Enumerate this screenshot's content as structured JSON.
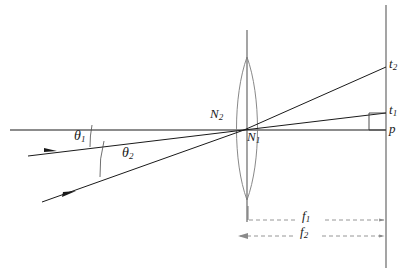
{
  "figure": {
    "kind": "optical-ray-diagram",
    "title": "",
    "background_color": "#ffffff",
    "line_color": "#1a1a1a",
    "dashed_color": "#8a8a8a",
    "thin_color": "#6f6f6f"
  },
  "labels": {
    "theta1": {
      "base": "θ",
      "sub": "1",
      "x": 77,
      "y": 136
    },
    "theta2": {
      "base": "θ",
      "sub": "2",
      "x": 124,
      "y": 152
    },
    "n2": {
      "base": "N",
      "sub": "2",
      "x": 212,
      "y": 113
    },
    "n1": {
      "base": "N",
      "sub": "1",
      "x": 249,
      "y": 134
    },
    "t2": {
      "base": "t",
      "sub": "2",
      "x": 390,
      "y": 62
    },
    "t1": {
      "base": "t",
      "sub": "1",
      "x": 390,
      "y": 108
    },
    "p": {
      "base": "p",
      "sub": "",
      "x": 390,
      "y": 125
    },
    "f1": {
      "base": "f",
      "sub": "1",
      "x": 308,
      "y": 215
    },
    "f2": {
      "base": "f",
      "sub": "2",
      "x": 306,
      "y": 231
    }
  },
  "geometry": {
    "optical_axis": {
      "x1": 10,
      "y1": 130,
      "x2": 386,
      "y2": 130
    },
    "lens_axis": {
      "x1": 247,
      "y1": 30,
      "x2": 247,
      "y2": 222
    },
    "lens_top_vertex": {
      "x": 247,
      "y": 57
    },
    "lens_bottom_vertex": {
      "x": 247,
      "y": 200
    },
    "lens_half_width": 14,
    "screen": {
      "x": 386,
      "y1": 5,
      "y2": 268
    },
    "nodal_point": {
      "x": 244,
      "y": 130
    },
    "ray1_in": {
      "x1": 28,
      "y1": 156,
      "x2": 244,
      "y2": 130
    },
    "ray1_out": {
      "x1": 244,
      "y1": 130,
      "x2": 386,
      "y2": 113
    },
    "ray2_in": {
      "x1": 42,
      "y1": 202,
      "x2": 244,
      "y2": 130
    },
    "ray2_out": {
      "x1": 244,
      "y1": 130,
      "x2": 386,
      "y2": 67
    },
    "right_angle_marker": {
      "x": 369,
      "y": 113,
      "size": 17
    },
    "f1_dim": {
      "x1": 247,
      "y1": 220,
      "x2": 386,
      "y2": 220,
      "tick_top": 206
    },
    "f2_dim": {
      "x1": 238,
      "y1": 236,
      "x2": 386,
      "y2": 236
    },
    "arc1": {
      "cx": 10,
      "cy": 130,
      "r": 108
    },
    "arc2": {
      "cx": 10,
      "cy": 130,
      "r": 135
    }
  },
  "elements": {
    "optical_axis_name": "optical-axis",
    "lens_name": "biconvex-lens",
    "screen_name": "image-screen"
  }
}
